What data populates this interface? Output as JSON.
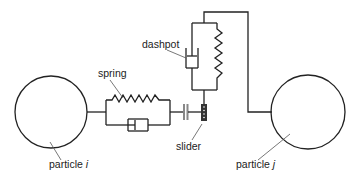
{
  "diagram": {
    "labels": {
      "spring": "spring",
      "dashpot": "dashpot",
      "slider": "slider",
      "particle_i_prefix": "particle ",
      "particle_i_var": "i",
      "particle_j_prefix": "particle ",
      "particle_j_var": "j"
    },
    "colors": {
      "stroke": "#222222",
      "leader": "#555555",
      "slider_fill": "#333333",
      "gap_fill": "#888888"
    },
    "components": [
      {
        "name": "particle i",
        "type": "circle"
      },
      {
        "name": "spring (normal)",
        "type": "spring"
      },
      {
        "name": "dashpot (normal)",
        "type": "dashpot"
      },
      {
        "name": "gap element",
        "type": "plates"
      },
      {
        "name": "slider",
        "type": "slider"
      },
      {
        "name": "dashpot (tangential)",
        "type": "dashpot"
      },
      {
        "name": "spring (tangential)",
        "type": "spring"
      },
      {
        "name": "particle j",
        "type": "circle"
      }
    ]
  }
}
